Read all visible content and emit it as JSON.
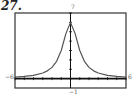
{
  "problem": {
    "number": "27."
  },
  "chart_data": {
    "type": "line",
    "title": "",
    "xlabel": "",
    "ylabel": "",
    "xlim": [
      -6,
      6
    ],
    "ylim": [
      -1,
      7
    ],
    "grid": false,
    "legend": "none",
    "tick_labels": {
      "xmin": "−6",
      "xmax": "6",
      "ymin": "−1",
      "ymax": "7"
    },
    "x_ticks": [
      -6,
      -5,
      -4,
      -3,
      -2,
      -1,
      0,
      1,
      2,
      3,
      4,
      5,
      6
    ],
    "y_ticks": [
      0,
      1,
      2,
      3,
      4,
      5,
      6,
      7
    ],
    "series": [
      {
        "name": "f(x)",
        "x": [
          -6,
          -5,
          -4,
          -3,
          -2.5,
          -2,
          -1.5,
          -1,
          -0.5,
          0,
          0.5,
          1,
          1.5,
          2,
          2.5,
          3,
          4,
          5,
          6
        ],
        "y": [
          0.16,
          0.23,
          0.35,
          0.6,
          0.83,
          1.2,
          1.85,
          3.0,
          4.8,
          6.0,
          4.8,
          3.0,
          1.85,
          1.2,
          0.83,
          0.6,
          0.35,
          0.23,
          0.16
        ]
      }
    ],
    "colors": {
      "curve": "#555555",
      "axis": "#111111",
      "frame": "#333333"
    }
  }
}
